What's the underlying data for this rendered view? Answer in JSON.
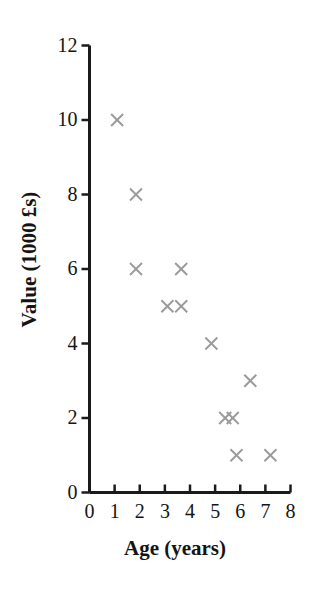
{
  "chart_data": {
    "type": "scatter",
    "title": "",
    "xlabel": "Age (years)",
    "ylabel": "Value (1000 £s)",
    "xlim": [
      0,
      8
    ],
    "ylim": [
      0,
      12
    ],
    "xticks": [
      "0",
      "1",
      "2",
      "3",
      "4",
      "5",
      "6",
      "7",
      "8"
    ],
    "yticks": [
      "0",
      "2",
      "4",
      "6",
      "8",
      "10",
      "12"
    ],
    "grid": false,
    "legend": null,
    "marker": "x",
    "marker_color": "#9a9a9a",
    "axis_color": "#1a1a1a",
    "points": [
      {
        "x": 1.1,
        "y": 10
      },
      {
        "x": 1.85,
        "y": 8
      },
      {
        "x": 1.85,
        "y": 6
      },
      {
        "x": 3.65,
        "y": 6
      },
      {
        "x": 3.1,
        "y": 5
      },
      {
        "x": 3.65,
        "y": 5
      },
      {
        "x": 4.85,
        "y": 4
      },
      {
        "x": 6.4,
        "y": 3
      },
      {
        "x": 5.4,
        "y": 2
      },
      {
        "x": 5.7,
        "y": 2
      },
      {
        "x": 5.85,
        "y": 1
      },
      {
        "x": 7.2,
        "y": 1
      }
    ]
  },
  "axes": {
    "x_tick_values": [
      0,
      1,
      2,
      3,
      4,
      5,
      6,
      7,
      8
    ],
    "y_tick_values": [
      0,
      2,
      4,
      6,
      8,
      10,
      12
    ]
  }
}
